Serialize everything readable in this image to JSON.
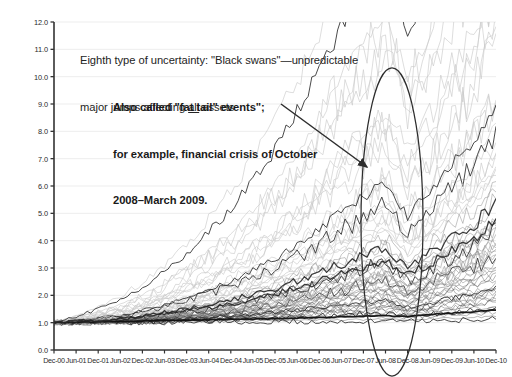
{
  "annotations": {
    "black_swans": {
      "line1_a": "Eighth type of uncertainty: \"Black swans\"—unpredictable",
      "line2_a": "major jumps affecting ",
      "line2_underlined": "all",
      "line2_b": " assets"
    },
    "fat_tail": {
      "line1": "Also called \"fat tail\" events\";",
      "line2": "for example, financial crisis of October",
      "line3": "2008–March 2009."
    },
    "shapes": {
      "ellipse_label": "crisis-highlight-ellipse",
      "arrow_label": "annotation-arrow"
    }
  },
  "chart_data": {
    "type": "line",
    "title": "",
    "xlabel": "",
    "ylabel": "",
    "ylim": [
      0.0,
      12.0
    ],
    "ytick_step": 1.0,
    "grid": true,
    "legend": "none",
    "n_series": 64,
    "note": "Growth of $1 invested Dec-2000 across many assets; all series indexed to 1.0 at Dec-00.",
    "ytick_labels": [
      "0.0",
      "1.0",
      "2.0",
      "3.0",
      "4.0",
      "5.0",
      "6.0",
      "7.0",
      "8.0",
      "9.0",
      "10.0",
      "11.0",
      "12.0"
    ],
    "ytick_values": [
      0,
      1,
      2,
      3,
      4,
      5,
      6,
      7,
      8,
      9,
      10,
      11,
      12
    ],
    "categories": [
      "Dec-00",
      "Jun-01",
      "Dec-01",
      "Jun-02",
      "Dec-02",
      "Jun-03",
      "Dec-03",
      "Jun-04",
      "Dec-04",
      "Jun-05",
      "Dec-05",
      "Jun-06",
      "Dec-06",
      "Jun-07",
      "Dec-07",
      "Jun-08",
      "Dec-08",
      "Jun-09",
      "Dec-09",
      "Jun-10",
      "Dec-10"
    ],
    "colors": {
      "axis": "#333333",
      "grid": "#e9e9e9",
      "series_dark": "#2b2b2b",
      "series_mid": "#8a8a8a",
      "series_light": "#c9c9c9",
      "annotation": "#2d2d2d"
    },
    "highlight": {
      "label": "Black swan / fat-tail period",
      "x_start": "Jun-08",
      "x_end": "Jun-09",
      "y_min": 0.0,
      "y_max": 11.3
    },
    "series": [
      {
        "name": "S01",
        "shade": "light",
        "values": [
          1.0,
          1.06,
          1.15,
          1.22,
          1.35,
          1.52,
          1.78,
          1.95,
          2.2,
          2.55,
          2.9,
          3.35,
          3.9,
          4.45,
          5.05,
          5.6,
          4.6,
          5.35,
          6.3,
          7.05,
          7.95
        ]
      },
      {
        "name": "S02",
        "shade": "light",
        "values": [
          1.0,
          1.1,
          1.22,
          1.38,
          1.55,
          1.8,
          2.1,
          2.45,
          2.85,
          3.3,
          3.85,
          4.4,
          5.15,
          5.95,
          6.65,
          7.3,
          5.9,
          6.9,
          8.1,
          9.05,
          10.7
        ]
      },
      {
        "name": "S03",
        "shade": "light",
        "values": [
          1.0,
          1.04,
          1.12,
          1.18,
          1.28,
          1.42,
          1.62,
          1.8,
          2.02,
          2.32,
          2.62,
          3.0,
          3.45,
          3.95,
          4.45,
          4.9,
          4.0,
          4.65,
          5.5,
          6.2,
          7.25
        ]
      },
      {
        "name": "S04",
        "shade": "mid",
        "values": [
          1.0,
          1.08,
          1.18,
          1.3,
          1.46,
          1.68,
          1.92,
          2.2,
          2.52,
          2.88,
          3.3,
          3.78,
          4.32,
          4.92,
          5.45,
          5.95,
          4.75,
          5.6,
          6.6,
          7.4,
          9.25
        ]
      },
      {
        "name": "S05",
        "shade": "mid",
        "values": [
          1.0,
          1.03,
          1.09,
          1.14,
          1.22,
          1.33,
          1.48,
          1.62,
          1.78,
          1.98,
          2.2,
          2.46,
          2.76,
          3.08,
          3.38,
          3.66,
          3.0,
          3.45,
          4.0,
          4.45,
          5.1
        ]
      },
      {
        "name": "S06",
        "shade": "mid",
        "values": [
          1.0,
          1.05,
          1.11,
          1.18,
          1.27,
          1.4,
          1.56,
          1.72,
          1.9,
          2.12,
          2.36,
          2.64,
          2.98,
          3.34,
          3.68,
          4.0,
          3.25,
          3.8,
          4.45,
          4.95,
          5.95
        ]
      },
      {
        "name": "S07",
        "shade": "dark",
        "values": [
          1.0,
          1.02,
          1.06,
          1.1,
          1.16,
          1.25,
          1.36,
          1.46,
          1.58,
          1.72,
          1.88,
          2.06,
          2.28,
          2.5,
          2.72,
          2.92,
          2.35,
          2.7,
          3.1,
          3.42,
          4.2
        ]
      },
      {
        "name": "S08",
        "shade": "dark",
        "values": [
          1.0,
          1.01,
          1.03,
          1.05,
          1.09,
          1.15,
          1.22,
          1.29,
          1.37,
          1.47,
          1.58,
          1.7,
          1.85,
          2.0,
          2.15,
          2.28,
          1.85,
          2.08,
          2.35,
          2.55,
          3.05
        ]
      },
      {
        "name": "S09",
        "shade": "dark",
        "values": [
          1.0,
          1.01,
          1.02,
          1.03,
          1.05,
          1.08,
          1.12,
          1.16,
          1.21,
          1.27,
          1.34,
          1.42,
          1.51,
          1.6,
          1.69,
          1.77,
          1.48,
          1.62,
          1.78,
          1.9,
          2.15
        ]
      },
      {
        "name": "S10-bond",
        "shade": "dark",
        "values": [
          1.0,
          1.02,
          1.04,
          1.05,
          1.07,
          1.08,
          1.09,
          1.11,
          1.12,
          1.14,
          1.15,
          1.17,
          1.19,
          1.21,
          1.24,
          1.26,
          1.22,
          1.3,
          1.35,
          1.4,
          1.46
        ]
      }
    ]
  }
}
